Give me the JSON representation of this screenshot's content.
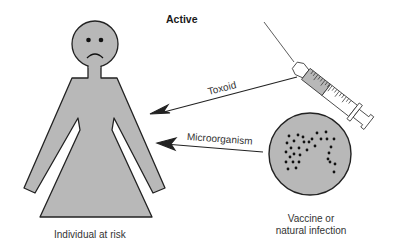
{
  "diagram": {
    "title": "Active",
    "nodes": {
      "individual": {
        "label": "Individual at risk",
        "icon": "sad-person-icon"
      },
      "source": {
        "label_line1": "Vaccine or",
        "label_line2": "natural infection",
        "icon": "culture-dish-icon"
      },
      "syringe": {
        "icon": "syringe-icon"
      }
    },
    "edges": [
      {
        "from": "syringe",
        "to": "individual",
        "label": "Toxoid"
      },
      {
        "from": "source",
        "to": "individual",
        "label": "Microorganism"
      }
    ],
    "colors": {
      "fill_gray": "#b8b8b8",
      "outline": "#222222",
      "background": "#ffffff"
    }
  }
}
